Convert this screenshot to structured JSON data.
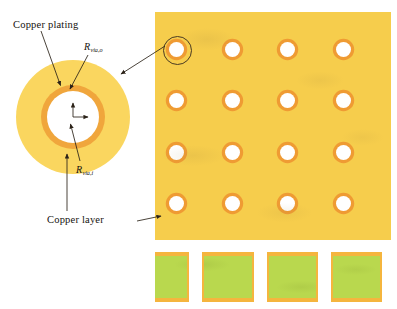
{
  "diagram": {
    "labels": {
      "copper_plating": "Copper plating",
      "copper_layer": "Copper layer",
      "r_via_outer_symbol": "R",
      "r_via_outer_sub": "via,o",
      "r_via_inner_symbol": "R",
      "r_via_inner_sub": "via,i"
    },
    "colors": {
      "copper_layer_yellow": "#f6cd4c",
      "copper_plating_orange": "#ef9b33",
      "via_hole_white": "#ffffff",
      "substrate_green": "#b9d84e",
      "copper_foil_orange": "#f5b53e",
      "annotation_line": "#4a3a22",
      "magnified_disc_yellow": "#fad65f",
      "magnified_ring_orange": "#f0a63c"
    },
    "magnified_via": {
      "name": "via-cross-section-magnified",
      "outer_disc_label": "Copper layer",
      "ring_label": "Copper plating",
      "inner_hole_label": "via hole",
      "outer_radius_label": "R via,o",
      "inner_radius_label": "R via,i"
    },
    "pcb_panel": {
      "name": "pcb-panel-via-array",
      "grid_rows": 4,
      "grid_columns": 4,
      "via_count": 16,
      "highlighted_via_position": "row 1, column 1",
      "via_positions": [
        {
          "row": 1,
          "col": 1,
          "x": 14,
          "y": 30,
          "highlighted": true
        },
        {
          "row": 1,
          "col": 2,
          "x": 70,
          "y": 30,
          "highlighted": false
        },
        {
          "row": 1,
          "col": 3,
          "x": 125,
          "y": 30,
          "highlighted": false
        },
        {
          "row": 1,
          "col": 4,
          "x": 181,
          "y": 30,
          "highlighted": false
        },
        {
          "row": 2,
          "col": 1,
          "x": 14,
          "y": 81,
          "highlighted": false
        },
        {
          "row": 2,
          "col": 2,
          "x": 70,
          "y": 81,
          "highlighted": false
        },
        {
          "row": 2,
          "col": 3,
          "x": 125,
          "y": 81,
          "highlighted": false
        },
        {
          "row": 2,
          "col": 4,
          "x": 181,
          "y": 81,
          "highlighted": false
        },
        {
          "row": 3,
          "col": 1,
          "x": 14,
          "y": 133,
          "highlighted": false
        },
        {
          "row": 3,
          "col": 2,
          "x": 70,
          "y": 133,
          "highlighted": false
        },
        {
          "row": 3,
          "col": 3,
          "x": 125,
          "y": 133,
          "highlighted": false
        },
        {
          "row": 3,
          "col": 4,
          "x": 181,
          "y": 133,
          "highlighted": false
        },
        {
          "row": 4,
          "col": 1,
          "x": 14,
          "y": 184,
          "highlighted": false
        },
        {
          "row": 4,
          "col": 2,
          "x": 70,
          "y": 184,
          "highlighted": false
        },
        {
          "row": 4,
          "col": 3,
          "x": 125,
          "y": 184,
          "highlighted": false
        },
        {
          "row": 4,
          "col": 4,
          "x": 181,
          "y": 184,
          "highlighted": false
        }
      ]
    },
    "cross_section": {
      "name": "pcb-cross-section-strip",
      "substrate_label": "substrate",
      "top_layer_label": "Copper layer",
      "bottom_layer_label": "Copper layer",
      "via_slot_count": 4,
      "via_slot_x": [
        32,
        97,
        161,
        225
      ]
    }
  }
}
